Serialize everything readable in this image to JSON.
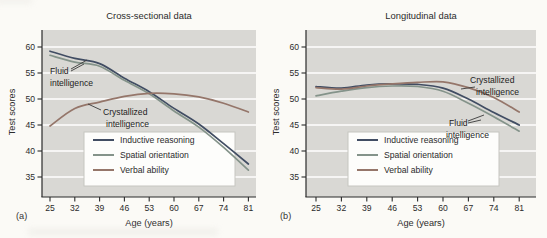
{
  "colors": {
    "plot_bg": "#d9d8d4",
    "grid": "#ffffff",
    "axis": "#2b2b2b",
    "inductive": "#414d63",
    "spatial": "#84938a",
    "verbal": "#95766a",
    "legend_bg": "#fdfdfb",
    "legend_border": "#c6c5c0"
  },
  "chart_data": [
    {
      "type": "line",
      "title": "Cross-sectional data",
      "panel_label": "(a)",
      "xlabel": "Age (years)",
      "ylabel": "Test scores",
      "x": [
        25,
        32,
        39,
        46,
        53,
        60,
        67,
        74,
        81
      ],
      "yticks": [
        35,
        40,
        45,
        50,
        55,
        60
      ],
      "ylim": [
        35,
        60
      ],
      "grid": "horizontal",
      "legend_position": "lower center inside",
      "series": [
        {
          "name": "Inductive reasoning",
          "color_key": "inductive",
          "values": [
            59.2,
            57.8,
            56.8,
            54.0,
            51.4,
            48.2,
            45.2,
            41.4,
            37.5
          ]
        },
        {
          "name": "Spatial orientation",
          "color_key": "spatial",
          "values": [
            58.4,
            57.1,
            56.3,
            53.6,
            51.0,
            47.7,
            44.6,
            40.7,
            36.3
          ]
        },
        {
          "name": "Verbal ability",
          "color_key": "verbal",
          "values": [
            44.8,
            48.2,
            49.4,
            50.5,
            51.1,
            51.0,
            50.4,
            49.2,
            47.5
          ]
        }
      ],
      "legend": [
        "Inductive reasoning",
        "Spatial orientation",
        "Verbal ability"
      ],
      "annotations": [
        {
          "text": "Fluid intelligence",
          "lines": [
            "Fluid",
            "intelligence"
          ]
        },
        {
          "text": "Crystallized intelligence",
          "lines": [
            "Crystallized",
            "intelligence"
          ]
        }
      ]
    },
    {
      "type": "line",
      "title": "Longitudinal data",
      "panel_label": "(b)",
      "xlabel": "Age (years)",
      "ylabel": "Test scores",
      "x": [
        25,
        32,
        39,
        46,
        53,
        60,
        67,
        74,
        81
      ],
      "yticks": [
        35,
        40,
        45,
        50,
        55,
        60
      ],
      "ylim": [
        35,
        60
      ],
      "grid": "horizontal",
      "legend_position": "lower center inside",
      "series": [
        {
          "name": "Inductive reasoning",
          "color_key": "inductive",
          "values": [
            52.4,
            52.1,
            52.7,
            52.9,
            52.8,
            52.1,
            50.0,
            47.4,
            45.0
          ]
        },
        {
          "name": "Spatial orientation",
          "color_key": "spatial",
          "values": [
            50.6,
            51.5,
            52.2,
            52.5,
            52.4,
            51.5,
            49.2,
            46.6,
            43.8
          ]
        },
        {
          "name": "Verbal ability",
          "color_key": "verbal",
          "values": [
            52.2,
            51.9,
            52.5,
            52.9,
            53.2,
            53.3,
            52.2,
            50.3,
            47.5
          ]
        }
      ],
      "legend": [
        "Inductive reasoning",
        "Spatial orientation",
        "Verbal ability"
      ],
      "annotations": [
        {
          "text": "Crystallized intelligence",
          "lines": [
            "Crystallized",
            "intelligence"
          ]
        },
        {
          "text": "Fluid intelligence",
          "lines": [
            "Fluid",
            "intelligence"
          ]
        }
      ]
    }
  ]
}
